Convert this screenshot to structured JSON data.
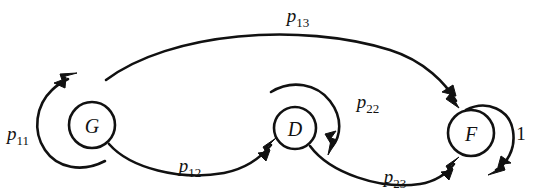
{
  "figure": {
    "type": "state-transition-diagram",
    "background_color": "#ffffff",
    "line_color": "#111111",
    "width": 535,
    "height": 192
  },
  "nodes": [
    {
      "id": "G",
      "label": "G",
      "cx": 92,
      "cy": 125,
      "r": 23
    },
    {
      "id": "D",
      "label": "D",
      "cx": 295,
      "cy": 128,
      "r": 21
    },
    {
      "id": "F",
      "label": "F",
      "cx": 471,
      "cy": 133,
      "r": 23
    }
  ],
  "edges": [
    {
      "id": "p11",
      "from": "G",
      "to": "G",
      "kind": "self-loop",
      "label_base": "p",
      "label_sub": "11",
      "label_x": 18,
      "label_y": 140
    },
    {
      "id": "p12",
      "from": "G",
      "to": "D",
      "kind": "arc",
      "label_base": "p",
      "label_sub": "12",
      "label_x": 190,
      "label_y": 172
    },
    {
      "id": "p13",
      "from": "G",
      "to": "F",
      "kind": "arc",
      "label_base": "p",
      "label_sub": "13",
      "label_x": 298,
      "label_y": 22
    },
    {
      "id": "p22",
      "from": "D",
      "to": "D",
      "kind": "self-loop",
      "label_base": "p",
      "label_sub": "22",
      "label_x": 368,
      "label_y": 108
    },
    {
      "id": "p23",
      "from": "D",
      "to": "F",
      "kind": "arc",
      "label_base": "p",
      "label_sub": "23",
      "label_x": 395,
      "label_y": 183
    },
    {
      "id": "one",
      "from": "F",
      "to": "F",
      "kind": "self-loop",
      "label_base": "1",
      "label_sub": "",
      "label_x": 521,
      "label_y": 140
    }
  ]
}
